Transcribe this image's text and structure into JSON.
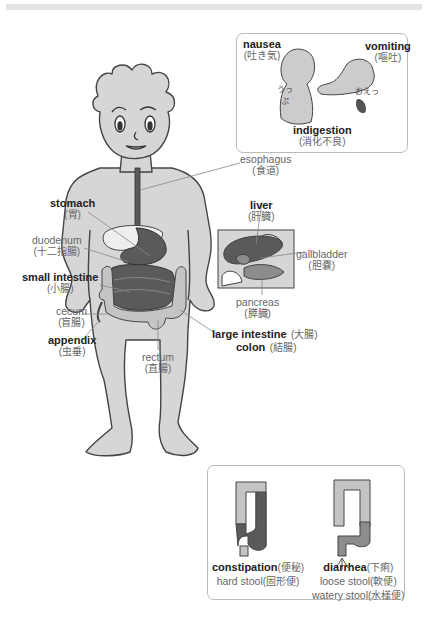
{
  "diagram": {
    "colors": {
      "skin": "#d6d6d6",
      "outline": "#444444",
      "organ_dark": "#5a5a5a",
      "organ_mid": "#8c8c8c",
      "organ_light": "#c4c4c4",
      "leader_line": "#888888",
      "panel_border": "#bbbbbb"
    },
    "labels": {
      "esophagus": {
        "en": "esophagus",
        "ja": "(食道)"
      },
      "stomach": {
        "en": "stomach",
        "ja": "(胃)"
      },
      "duodenum": {
        "en": "duodenum",
        "ja": "(十二指腸)"
      },
      "small_intestine": {
        "en": "small intestine",
        "ja": "(小腸)"
      },
      "cecum": {
        "en": "cecum",
        "ja": "(盲腸)"
      },
      "appendix": {
        "en": "appendix",
        "ja": "(虫垂)"
      },
      "rectum": {
        "en": "rectum",
        "ja": "(直腸)"
      },
      "liver": {
        "en": "liver",
        "ja": "(肝臓)"
      },
      "gallbladder": {
        "en": "gallbladder",
        "ja": "(胆嚢)"
      },
      "pancreas": {
        "en": "pancreas",
        "ja": "(膵臓)"
      },
      "large_intestine": {
        "en": "large intestine",
        "ja": "(大腸)"
      },
      "colon": {
        "en": "colon",
        "ja": "(結腸)"
      }
    },
    "symptoms_panel": {
      "nausea": {
        "en": "nausea",
        "ja": "(吐き気)"
      },
      "vomiting": {
        "en": "vomiting",
        "ja": "(嘔吐)"
      },
      "indigestion": {
        "en": "indigestion",
        "ja": "(消化不良)"
      },
      "sfx_nausea": "うっぷ",
      "sfx_vomit": "おえっ"
    },
    "stool_panel": {
      "constipation": {
        "en": "constipation",
        "ja": "(便秘)",
        "stool": "hard stool",
        "stool_ja": "(固形便)"
      },
      "diarrhea": {
        "en": "diarrhea",
        "ja": "(下痢)",
        "stool1": "loose stool",
        "stool1_ja": "(軟便)",
        "stool2": "watery stool",
        "stool2_ja": "(水様便)"
      }
    }
  }
}
